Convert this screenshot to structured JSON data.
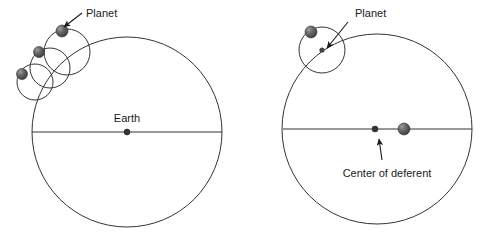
{
  "figure": {
    "title": "",
    "background": "#ffffff",
    "stroke_color": "#333333",
    "sphere_fill": "#5a5a5a",
    "sphere_highlight": "#b5b5b5",
    "dot_color": "#333333",
    "text_color": "#1a1a1a",
    "width": 496,
    "height": 243
  },
  "left_panel": {
    "name": "epicycle-on-concentric-deferent",
    "deferent": {
      "cx": 127,
      "cy": 132,
      "r": 95
    },
    "diameter_line": {
      "x1": 32,
      "y1": 132,
      "x2": 222,
      "y2": 132
    },
    "earth": {
      "label": "Earth",
      "dot": {
        "cx": 127,
        "cy": 132,
        "r": 3.2
      },
      "label_x": 127,
      "label_y": 122
    },
    "planet_label": {
      "text": "Planet",
      "x": 86,
      "y": 17,
      "arrow": {
        "x1": 82,
        "y1": 13,
        "x2": 64,
        "y2": 27
      }
    },
    "epicycles": [
      {
        "cx": 35,
        "cy": 82,
        "r": 18,
        "planet": {
          "cx": 22,
          "cy": 74,
          "r": 5.5
        }
      },
      {
        "cx": 50,
        "cy": 68,
        "r": 20,
        "planet": {
          "cx": 39,
          "cy": 52,
          "r": 5.5
        }
      },
      {
        "cx": 67,
        "cy": 52,
        "r": 23,
        "planet": {
          "cx": 62,
          "cy": 31,
          "r": 6.0
        }
      }
    ]
  },
  "right_panel": {
    "name": "epicycle-on-eccentric-deferent",
    "deferent": {
      "cx": 377,
      "cy": 129,
      "r": 95
    },
    "diameter_line": {
      "x1": 283,
      "y1": 129,
      "x2": 472,
      "y2": 129
    },
    "center_of_deferent": {
      "label": "Center of deferent",
      "dot": {
        "cx": 375,
        "cy": 129,
        "r": 3.2
      },
      "label_x": 387,
      "label_y": 177,
      "arrow": {
        "x1": 382,
        "y1": 160,
        "x2": 379,
        "y2": 139
      }
    },
    "earth_sphere": {
      "cx": 404,
      "cy": 129,
      "r": 6.0
    },
    "planet_label": {
      "text": "Planet",
      "x": 355,
      "y": 17,
      "arrow": {
        "x1": 348,
        "y1": 22,
        "x2": 327,
        "y2": 48
      }
    },
    "epicycle": {
      "cx": 322,
      "cy": 50,
      "r": 23
    },
    "epicycle_center_dot": {
      "cx": 322,
      "cy": 50,
      "r": 2.6
    },
    "planet_sphere": {
      "cx": 311,
      "cy": 32,
      "r": 6.0
    }
  }
}
